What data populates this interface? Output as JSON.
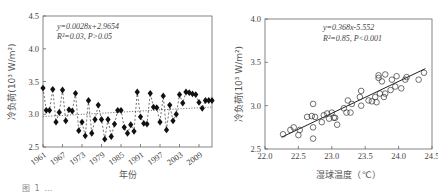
{
  "chart_data": [
    {
      "type": "line",
      "panel": "left",
      "title": "",
      "xlabel": "年份",
      "ylabel": "冷负荷(10³ W/m²)",
      "ylim": [
        2.5,
        4.5
      ],
      "xlim": [
        1961,
        2013
      ],
      "yticks": [
        "2.5",
        "3.0",
        "3.5",
        "4.0",
        "4.5"
      ],
      "xticks": [
        "1961",
        "1967",
        "1973",
        "1979",
        "1985",
        "1991",
        "1997",
        "2003",
        "2009"
      ],
      "annotation": [
        "y=0.0028x+2.9654",
        "R²=0.03, P>0.05"
      ],
      "grid": false,
      "marker": "filled-diamond",
      "trendline": {
        "slope": 0.0028,
        "intercept": 2.9654,
        "style": "dotted"
      },
      "x": [
        1961,
        1962,
        1963,
        1964,
        1965,
        1966,
        1967,
        1968,
        1969,
        1970,
        1971,
        1972,
        1973,
        1974,
        1975,
        1976,
        1977,
        1978,
        1979,
        1980,
        1981,
        1982,
        1983,
        1984,
        1985,
        1986,
        1987,
        1988,
        1989,
        1990,
        1991,
        1992,
        1993,
        1994,
        1995,
        1996,
        1997,
        1998,
        1999,
        2000,
        2001,
        2002,
        2003,
        2004,
        2005,
        2006,
        2007,
        2008,
        2009,
        2010,
        2011,
        2012,
        2013
      ],
      "values": [
        3.4,
        3.06,
        3.06,
        3.38,
        2.88,
        3.03,
        3.37,
        2.9,
        3.07,
        3.05,
        3.32,
        2.75,
        2.88,
        2.67,
        3.21,
        2.71,
        2.92,
        3.14,
        2.92,
        2.62,
        2.92,
        2.66,
        2.85,
        3.06,
        3.06,
        2.8,
        2.71,
        2.84,
        2.74,
        3.34,
        2.96,
        2.86,
        2.85,
        3.32,
        3.11,
        3.1,
        2.88,
        3.28,
        2.76,
        3.14,
        2.9,
        3.0,
        3.3,
        3.17,
        3.34,
        3.33,
        3.31,
        3.3,
        3.18,
        3.09,
        3.21,
        3.21,
        3.21
      ]
    },
    {
      "type": "scatter",
      "panel": "right",
      "title": "",
      "xlabel": "湿球温度（℃）",
      "ylabel": "冷负荷(10³ W/m²)",
      "xlim": [
        22.0,
        24.5
      ],
      "ylim": [
        2.5,
        4.0
      ],
      "xticks": [
        "22.0",
        "22.5",
        "23.0",
        "23.5",
        "24.0",
        "24.5"
      ],
      "yticks": [
        "2.5",
        "3.0",
        "3.5",
        "4.0"
      ],
      "annotation": [
        "y=0.368x-5.552",
        "R²=0.85, P<0.001"
      ],
      "grid": false,
      "marker": "open-circle",
      "trendline": {
        "slope": 0.368,
        "intercept": -5.552,
        "style": "solid",
        "x_range": [
          22.25,
          24.4
        ]
      },
      "points": [
        [
          22.27,
          2.67
        ],
        [
          22.38,
          2.72
        ],
        [
          22.43,
          2.75
        ],
        [
          22.5,
          2.66
        ],
        [
          22.52,
          2.72
        ],
        [
          22.63,
          2.87
        ],
        [
          22.7,
          2.88
        ],
        [
          22.72,
          3.02
        ],
        [
          22.72,
          2.75
        ],
        [
          22.72,
          2.62
        ],
        [
          22.75,
          2.87
        ],
        [
          22.85,
          2.81
        ],
        [
          22.88,
          2.89
        ],
        [
          22.93,
          2.91
        ],
        [
          22.96,
          2.85
        ],
        [
          23.0,
          2.92
        ],
        [
          23.03,
          2.86
        ],
        [
          23.05,
          2.86
        ],
        [
          23.08,
          2.78
        ],
        [
          23.18,
          2.97
        ],
        [
          23.22,
          2.92
        ],
        [
          23.24,
          3.06
        ],
        [
          23.28,
          2.92
        ],
        [
          23.3,
          3.02
        ],
        [
          23.42,
          3.1
        ],
        [
          23.44,
          3.17
        ],
        [
          23.44,
          3.0
        ],
        [
          23.55,
          3.06
        ],
        [
          23.6,
          3.05
        ],
        [
          23.65,
          3.1
        ],
        [
          23.67,
          3.04
        ],
        [
          23.7,
          3.35
        ],
        [
          23.7,
          3.32
        ],
        [
          23.72,
          3.14
        ],
        [
          23.75,
          3.28
        ],
        [
          23.78,
          3.1
        ],
        [
          23.8,
          3.36
        ],
        [
          23.8,
          3.14
        ],
        [
          23.88,
          3.18
        ],
        [
          23.9,
          3.3
        ],
        [
          23.95,
          3.22
        ],
        [
          23.97,
          3.34
        ],
        [
          24.04,
          3.2
        ],
        [
          24.1,
          3.3
        ],
        [
          24.12,
          3.33
        ],
        [
          24.3,
          3.3
        ],
        [
          24.38,
          3.38
        ]
      ]
    }
  ],
  "caption": "图 1 …"
}
